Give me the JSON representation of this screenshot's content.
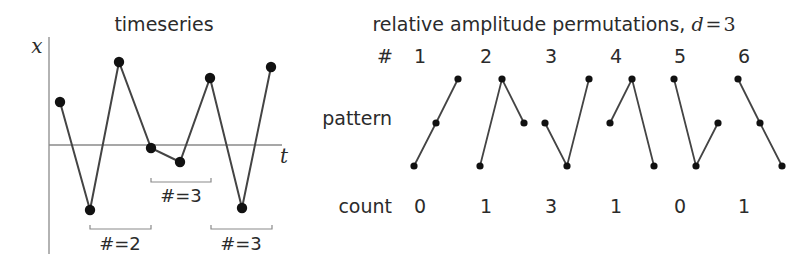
{
  "chart_data": [
    {
      "type": "line",
      "title": "timeseries",
      "xlabel": "t",
      "ylabel": "x",
      "grid": false,
      "points_px": [
        [
          60,
          102
        ],
        [
          90,
          210
        ],
        [
          119,
          62
        ],
        [
          151,
          148
        ],
        [
          180,
          162
        ],
        [
          210,
          78
        ],
        [
          242,
          208
        ],
        [
          271,
          67
        ]
      ],
      "relative_values": [
        1.3,
        -1.9,
        2.4,
        -0.05,
        -0.45,
        2.0,
        -1.85,
        2.3
      ],
      "annotations": [
        {
          "label": "#=2",
          "x_from": 90,
          "x_to": 151,
          "y": 229,
          "text_x": 120,
          "text_y": 250
        },
        {
          "label": "#=3",
          "x_from": 151,
          "x_to": 211,
          "y": 182,
          "text_x": 181,
          "text_y": 202
        },
        {
          "label": "#=3",
          "x_from": 211,
          "x_to": 272,
          "y": 229,
          "text_x": 241,
          "text_y": 250
        }
      ]
    },
    {
      "type": "table",
      "title_text": "relative amplitude permutations, ",
      "title_math_var": "d",
      "title_math_eq": "=",
      "title_math_val": "3",
      "row_labels": {
        "index": "#",
        "pattern": "pattern",
        "count": "count"
      },
      "columns": [
        {
          "id": "1",
          "count": "0",
          "ranks": [
            1,
            2,
            3
          ]
        },
        {
          "id": "2",
          "count": "1",
          "ranks": [
            1,
            3,
            2
          ]
        },
        {
          "id": "3",
          "count": "3",
          "ranks": [
            2,
            1,
            3
          ]
        },
        {
          "id": "4",
          "count": "1",
          "ranks": [
            2,
            3,
            1
          ]
        },
        {
          "id": "5",
          "count": "0",
          "ranks": [
            3,
            1,
            2
          ]
        },
        {
          "id": "6",
          "count": "1",
          "ranks": [
            3,
            2,
            1
          ]
        }
      ]
    }
  ],
  "left_panel": {
    "title": "timeseries",
    "x_axis_label": "t",
    "y_axis_label": "x",
    "annotations": [
      "#=2",
      "#=3",
      "#=3"
    ]
  },
  "right_panel": {
    "title": "relative amplitude permutations, ",
    "title_var": "d",
    "title_eq": "=",
    "title_val": "3",
    "index_label": "#",
    "pattern_label": "pattern",
    "count_label": "count",
    "indices": [
      "1",
      "2",
      "3",
      "4",
      "5",
      "6"
    ],
    "counts": [
      "0",
      "1",
      "3",
      "1",
      "0",
      "1"
    ]
  },
  "colors": {
    "text": "#2b2b2b",
    "axis": "#8a8a8a",
    "line": "#444444",
    "marker": "#111111",
    "background": "#ffffff"
  }
}
